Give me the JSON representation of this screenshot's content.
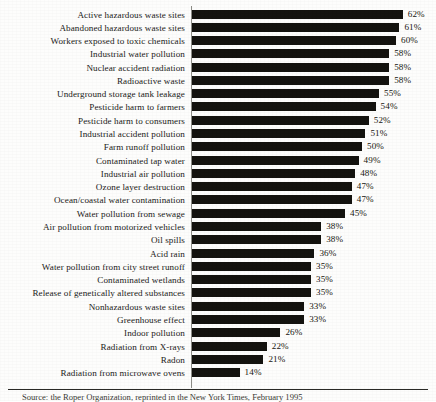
{
  "chart_data": {
    "type": "bar",
    "orientation": "horizontal",
    "title": "",
    "xlabel": "",
    "ylabel": "",
    "xlim": [
      0,
      62
    ],
    "grid": false,
    "legend": null,
    "value_suffix": "%",
    "categories": [
      "Active hazardous waste sites",
      "Abandoned hazardous waste sites",
      "Workers exposed to toxic chemicals",
      "Industrial water pollution",
      "Nuclear accident radiation",
      "Radioactive waste",
      "Underground storage tank leakage",
      "Pesticide harm to farmers",
      "Pesticide harm to consumers",
      "Industrial accident pollution",
      "Farm runoff pollution",
      "Contaminated tap water",
      "Industrial air pollution",
      "Ozone layer destruction",
      "Ocean/coastal water contamination",
      "Water pollution from sewage",
      "Air pollution from motorized vehicles",
      "Oil spills",
      "Acid rain",
      "Water pollution from city street runoff",
      "Contaminated wetlands",
      "Release of genetically altered substances",
      "Nonhazardous waste sites",
      "Greenhouse effect",
      "Indoor pollution",
      "Radiation from X-rays",
      "Radon",
      "Radiation from microwave ovens"
    ],
    "values": [
      62,
      61,
      60,
      58,
      58,
      58,
      55,
      54,
      52,
      51,
      50,
      49,
      48,
      47,
      47,
      45,
      38,
      38,
      36,
      35,
      35,
      35,
      33,
      33,
      26,
      22,
      21,
      14
    ],
    "value_labels": [
      "62%",
      "61%",
      "60%",
      "58%",
      "58%",
      "58%",
      "55%",
      "54%",
      "52%",
      "51%",
      "50%",
      "49%",
      "48%",
      "47%",
      "47%",
      "45%",
      "38%",
      "38%",
      "36%",
      "35%",
      "35%",
      "35%",
      "33%",
      "33%",
      "26%",
      "22%",
      "21%",
      "14%"
    ],
    "bar_color": "#14130f"
  },
  "footer": {
    "source_note": "Source: the Roper Organization, reprinted in the New York Times, February 1995"
  }
}
